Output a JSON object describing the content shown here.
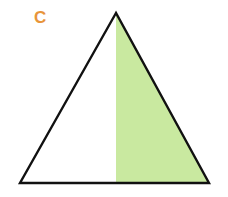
{
  "figure": {
    "label": "C",
    "label_color": "#e8943a",
    "shape": "triangle",
    "vertices": {
      "apex": [
        116,
        13
      ],
      "bottom_left": [
        20,
        183
      ],
      "bottom_right": [
        209,
        183
      ]
    },
    "shaded_region": {
      "description": "right half of triangle (from apex vertical line to right edge)",
      "fill_color": "#c9e9a0"
    },
    "outline_color": "#111111",
    "fraction_shaded": "1/2"
  }
}
